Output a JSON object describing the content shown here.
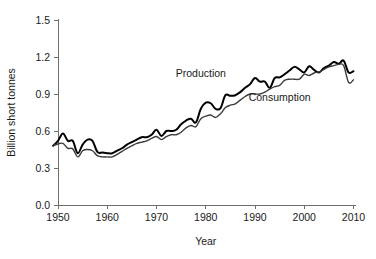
{
  "chart_data": {
    "type": "line",
    "title": "",
    "xlabel": "Year",
    "ylabel": "Billion short tonnes",
    "xlim": [
      1949,
      2010
    ],
    "ylim": [
      0.0,
      1.5
    ],
    "grid": false,
    "legend_position": "inline-annotation",
    "x_ticks": [
      "1950",
      "1960",
      "1970",
      "1980",
      "1990",
      "2000",
      "2010"
    ],
    "x_tick_values": [
      1950,
      1960,
      1970,
      1980,
      1990,
      2000,
      2010
    ],
    "y_ticks": [
      "0.0",
      "0.3",
      "0.6",
      "0.9",
      "1.2",
      "1.5"
    ],
    "y_tick_values": [
      0.0,
      0.3,
      0.6,
      0.9,
      1.2,
      1.5
    ],
    "x": [
      1949,
      1950,
      1951,
      1952,
      1953,
      1954,
      1955,
      1956,
      1957,
      1958,
      1959,
      1960,
      1961,
      1962,
      1963,
      1964,
      1965,
      1966,
      1967,
      1968,
      1969,
      1970,
      1971,
      1972,
      1973,
      1974,
      1975,
      1976,
      1977,
      1978,
      1979,
      1980,
      1981,
      1982,
      1983,
      1984,
      1985,
      1986,
      1987,
      1988,
      1989,
      1990,
      1991,
      1992,
      1993,
      1994,
      1995,
      1996,
      1997,
      1998,
      1999,
      2000,
      2001,
      2002,
      2003,
      2004,
      2005,
      2006,
      2007,
      2008,
      2009,
      2010
    ],
    "series": [
      {
        "name": "Production",
        "color": "#000000",
        "width": 2.0,
        "label_text": "Production",
        "label_x": 1979,
        "label_y": 1.04,
        "values": [
          0.48,
          0.52,
          0.58,
          0.52,
          0.52,
          0.42,
          0.49,
          0.53,
          0.52,
          0.43,
          0.425,
          0.42,
          0.42,
          0.44,
          0.46,
          0.49,
          0.51,
          0.53,
          0.55,
          0.55,
          0.57,
          0.61,
          0.56,
          0.6,
          0.6,
          0.61,
          0.655,
          0.685,
          0.7,
          0.67,
          0.78,
          0.83,
          0.825,
          0.78,
          0.785,
          0.89,
          0.885,
          0.89,
          0.915,
          0.95,
          0.98,
          1.03,
          1.0,
          1.0,
          0.95,
          1.03,
          1.035,
          1.06,
          1.09,
          1.12,
          1.1,
          1.075,
          1.125,
          1.095,
          1.075,
          1.11,
          1.13,
          1.16,
          1.145,
          1.17,
          1.075,
          1.085
        ]
      },
      {
        "name": "Consumption",
        "color": "#3b3b3b",
        "width": 1.4,
        "label_text": "Consumption",
        "label_x": 1995,
        "label_y": 0.845,
        "values": [
          0.48,
          0.495,
          0.5,
          0.46,
          0.455,
          0.39,
          0.44,
          0.45,
          0.44,
          0.4,
          0.39,
          0.39,
          0.39,
          0.41,
          0.435,
          0.46,
          0.48,
          0.5,
          0.51,
          0.52,
          0.54,
          0.555,
          0.53,
          0.555,
          0.57,
          0.57,
          0.59,
          0.625,
          0.645,
          0.635,
          0.7,
          0.72,
          0.73,
          0.71,
          0.74,
          0.79,
          0.81,
          0.82,
          0.85,
          0.88,
          0.9,
          0.9,
          0.9,
          0.915,
          0.94,
          0.96,
          0.97,
          1.01,
          1.02,
          1.02,
          1.02,
          1.06,
          1.05,
          1.07,
          1.08,
          1.1,
          1.12,
          1.13,
          1.14,
          1.13,
          0.995,
          1.015
        ]
      }
    ]
  }
}
